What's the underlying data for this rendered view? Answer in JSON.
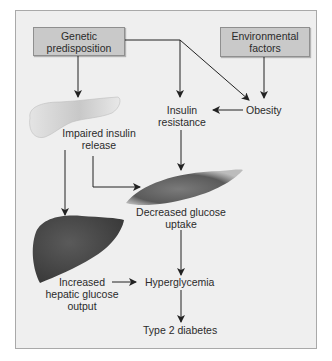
{
  "diagram": {
    "colors": {
      "panel_bg": "#efefef",
      "panel_border": "#a9a9a9",
      "box_fill": "#c9c9c9",
      "arrow": "#222222",
      "text": "#2b2b2b",
      "pancreas": "#dcdcdc",
      "muscle": "#6b6b6b",
      "liver": "#4a4a4a"
    },
    "boxes": {
      "genetic": {
        "line1": "Genetic",
        "line2": "predisposition"
      },
      "environmental": {
        "line1": "Environmental",
        "line2": "factors"
      }
    },
    "nodes": {
      "obesity": "Obesity",
      "insulin_resistance": {
        "line1": "Insulin",
        "line2": "resistance"
      },
      "impaired_release": {
        "line1": "Impaired insulin",
        "line2": "release"
      },
      "decreased_uptake": {
        "line1": "Decreased glucose",
        "line2": "uptake"
      },
      "hepatic_output": {
        "line1": "Increased",
        "line2": "hepatic glucose",
        "line3": "output"
      },
      "hyperglycemia": "Hyperglycemia",
      "type2": "Type 2 diabetes"
    },
    "organs": {
      "pancreas": "pancreas-illustration",
      "muscle": "muscle-illustration",
      "liver": "liver-illustration"
    },
    "edges": [
      {
        "from": "Genetic predisposition",
        "to": "Insulin resistance"
      },
      {
        "from": "Genetic predisposition",
        "to": "Obesity"
      },
      {
        "from": "Genetic predisposition",
        "to": "Impaired insulin release"
      },
      {
        "from": "Environmental factors",
        "to": "Obesity"
      },
      {
        "from": "Obesity",
        "to": "Insulin resistance"
      },
      {
        "from": "Insulin resistance",
        "to": "Decreased glucose uptake"
      },
      {
        "from": "Impaired insulin release",
        "to": "Decreased glucose uptake"
      },
      {
        "from": "Impaired insulin release",
        "to": "Increased hepatic glucose output"
      },
      {
        "from": "Decreased glucose uptake",
        "to": "Hyperglycemia"
      },
      {
        "from": "Increased hepatic glucose output",
        "to": "Hyperglycemia"
      },
      {
        "from": "Hyperglycemia",
        "to": "Type 2 diabetes"
      }
    ]
  }
}
